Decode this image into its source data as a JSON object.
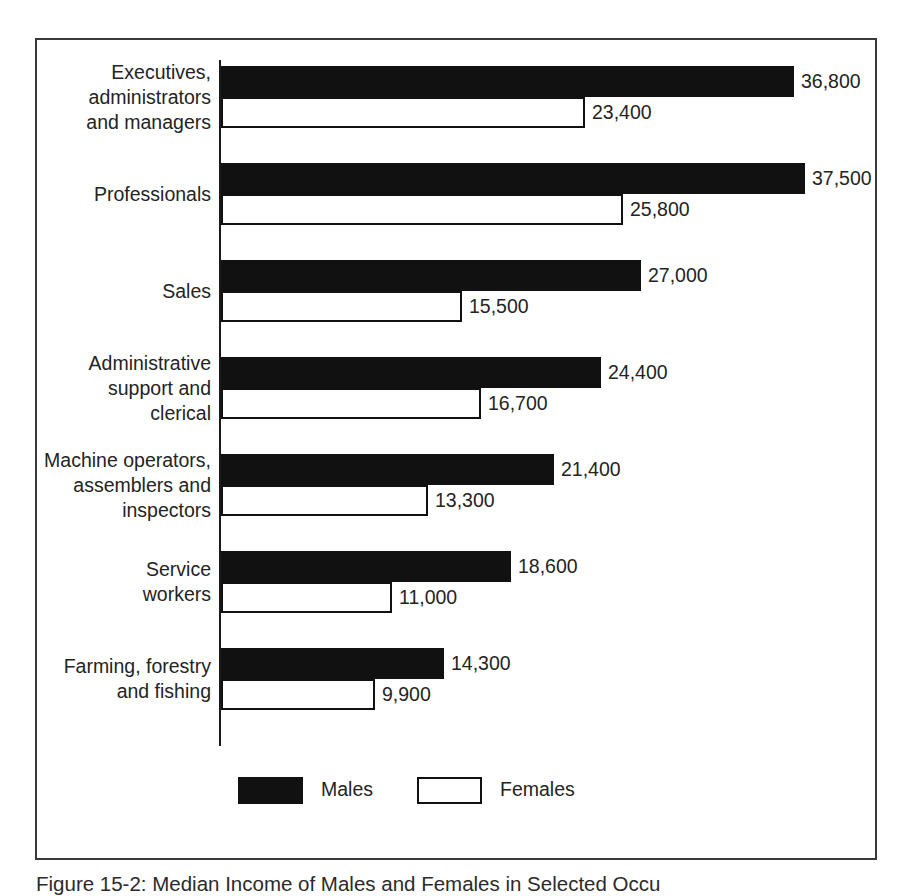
{
  "figure": {
    "caption": "Figure 15-2:  Median Income of Males and Females in Selected Occu"
  },
  "legend": {
    "position": "bottom-center",
    "items": [
      {
        "label": "Males",
        "swatch": "solid-black-swatch"
      },
      {
        "label": "Females",
        "swatch": "white-outlined-swatch"
      }
    ]
  },
  "colors": {
    "male_bar": "#111111",
    "female_bar_fill": "#ffffff",
    "female_bar_border": "#111111",
    "frame": "#3a3a3a",
    "text": "#242424"
  },
  "chart_data": {
    "type": "bar",
    "orientation": "horizontal",
    "title": "",
    "xlabel": "",
    "ylabel": "",
    "grid": false,
    "legend_position": "bottom-center",
    "xlim": [
      0,
      42000
    ],
    "categories": [
      "Executives,\nadministrators\nand managers",
      "Professionals",
      "Sales",
      "Administrative\nsupport and\nclerical",
      "Machine operators,\nassemblers and\ninspectors",
      "Service\nworkers",
      "Farming, forestry\nand fishing"
    ],
    "series": [
      {
        "name": "Males",
        "values": [
          36800,
          37500,
          27000,
          24400,
          21400,
          18600,
          14300
        ],
        "labels": [
          "36,800",
          "37,500",
          "27,000",
          "24,400",
          "21,400",
          "18,600",
          "14,300"
        ]
      },
      {
        "name": "Females",
        "values": [
          23400,
          25800,
          15500,
          16700,
          13300,
          11000,
          9900
        ],
        "labels": [
          "23,400",
          "25,800",
          "15,500",
          "16,700",
          "13,300",
          "11,000",
          "9,900"
        ]
      }
    ]
  }
}
